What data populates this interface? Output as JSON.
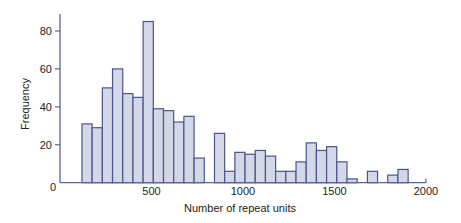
{
  "chart_data": {
    "type": "bar",
    "subtype": "histogram",
    "title": "",
    "xlabel": "Number of repeat units",
    "ylabel": "Frequency",
    "xlim": [
      0,
      2000
    ],
    "ylim": [
      0,
      88
    ],
    "x_ticks": [
      0,
      500,
      1000,
      1500,
      2000
    ],
    "y_ticks": [
      0,
      20,
      40,
      60,
      80
    ],
    "grid": false,
    "legend": null,
    "bin_start": 120,
    "bin_width": 55.7,
    "bin_centers": [
      148,
      204,
      259,
      315,
      371,
      426,
      482,
      538,
      594,
      649,
      705,
      761,
      817,
      872,
      928,
      984,
      1039,
      1095,
      1151,
      1207,
      1262,
      1318,
      1374,
      1429,
      1485,
      1541,
      1597,
      1652,
      1708,
      1764,
      1819,
      1875
    ],
    "values": [
      31,
      29,
      50,
      60,
      47,
      45,
      85,
      39,
      38,
      32,
      35,
      13,
      0,
      26,
      6,
      16,
      15,
      17,
      14,
      6,
      6,
      11,
      21,
      17,
      19,
      11,
      2,
      0,
      6,
      0,
      4,
      7
    ]
  },
  "colors": {
    "bar_fill": "#d3d7e6",
    "bar_stroke": "#4a5490",
    "axis": "#5a62a0",
    "text": "#222222"
  }
}
